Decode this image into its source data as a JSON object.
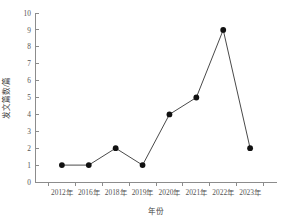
{
  "chart_data": {
    "type": "line",
    "title": "",
    "subtitle": "",
    "xlabel": "年份",
    "ylabel": "发文篇数/篇",
    "categories": [
      "2012年",
      "2016年",
      "2018年",
      "2019年",
      "2020年",
      "2021年",
      "2022年",
      "2023年"
    ],
    "values": [
      1,
      1,
      2,
      1,
      4,
      5,
      9,
      2
    ],
    "series": [
      {
        "name": "发文篇数",
        "values": [
          1,
          1,
          2,
          1,
          4,
          5,
          9,
          2
        ]
      }
    ],
    "ylim": [
      0,
      10
    ],
    "y_ticks": [
      "0",
      "1",
      "2",
      "3",
      "4",
      "5",
      "6",
      "7",
      "8",
      "9",
      "10"
    ],
    "x_ticks": [
      "2012年",
      "2016年",
      "2018年",
      "2019年",
      "2020年",
      "2021年",
      "2022年",
      "2023年"
    ],
    "grid": false,
    "legend": false,
    "legend_position": "none",
    "marker": "filled-circle",
    "colors": {
      "line": "#4a4a4a",
      "marker": "#111111",
      "axis": "#8c8c8c",
      "text": "#555555",
      "background": "#ffffff"
    },
    "annotations": []
  }
}
